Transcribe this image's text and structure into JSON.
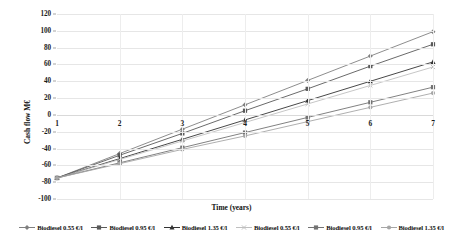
{
  "chart_data": {
    "type": "line",
    "title": "",
    "xlabel": "Time (years)",
    "ylabel": "Cash flow  M€",
    "x": [
      1,
      2,
      3,
      4,
      5,
      6,
      7
    ],
    "xtick_labels": [
      "1",
      "2",
      "3",
      "4",
      "5",
      "6",
      "7"
    ],
    "ytick_labels": [
      "120",
      "100",
      "80",
      "60",
      "40",
      "20",
      "0",
      "-20",
      "-40",
      "-60",
      "-80",
      "-100"
    ],
    "yticks": [
      120,
      100,
      80,
      60,
      40,
      20,
      0,
      -20,
      -40,
      -60,
      -80,
      -100
    ],
    "ylim": [
      -100,
      120
    ],
    "xlim": [
      1,
      7
    ],
    "grid": true,
    "legend_position": "bottom",
    "series": [
      {
        "name": "Biodiesel 0.55 €/l",
        "color": "#808080",
        "marker": "diamond",
        "values": [
          -75,
          -46,
          -17,
          12,
          41,
          70,
          99
        ]
      },
      {
        "name": "Biodiesel 0.95 €/l",
        "color": "#595959",
        "marker": "square",
        "values": [
          -75,
          -48,
          -22,
          5,
          31,
          58,
          84
        ]
      },
      {
        "name": "Biodiesel 1.35 €/l",
        "color": "#333333",
        "marker": "triangle",
        "values": [
          -75,
          -52,
          -29,
          -6,
          17,
          40,
          63
        ]
      },
      {
        "name": "Biodiesel 0.55 €/l",
        "color": "#bfbfbf",
        "marker": "cross",
        "values": [
          -75,
          -53,
          -31,
          -9,
          13,
          35,
          57
        ]
      },
      {
        "name": "Biodiesel 0.95 €/l",
        "color": "#737373",
        "marker": "square",
        "values": [
          -75,
          -57,
          -39,
          -21,
          -3,
          15,
          33
        ]
      },
      {
        "name": "Biodiesel 1.35 €/l",
        "color": "#a6a6a6",
        "marker": "circle",
        "values": [
          -75,
          -58,
          -41,
          -25,
          -8,
          9,
          26
        ]
      }
    ]
  }
}
